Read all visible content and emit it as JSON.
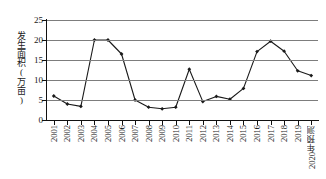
{
  "chart_data": {
    "type": "line",
    "title": "",
    "xlabel": "",
    "ylabel": "发生面积(万亩)",
    "ylim": [
      0,
      25
    ],
    "yticks": [
      0,
      5,
      10,
      15,
      20,
      25
    ],
    "grid": true,
    "legend": "none",
    "marker": "filled-diamond",
    "line_color": "#1a1a1a",
    "grid_color": "#7d7d7d",
    "categories": [
      "2001",
      "2002",
      "2003",
      "2004",
      "2005",
      "2006",
      "2007",
      "2008",
      "2009",
      "2010",
      "2011",
      "2012",
      "2013",
      "2014",
      "2015",
      "2016",
      "2017",
      "2018",
      "2019",
      "2020年预测"
    ],
    "values": [
      6.0,
      4.0,
      3.4,
      20.0,
      20.0,
      16.5,
      5.0,
      3.2,
      2.8,
      3.2,
      12.7,
      4.6,
      5.9,
      5.2,
      7.9,
      17.1,
      19.7,
      17.2,
      12.3,
      11.1
    ]
  }
}
